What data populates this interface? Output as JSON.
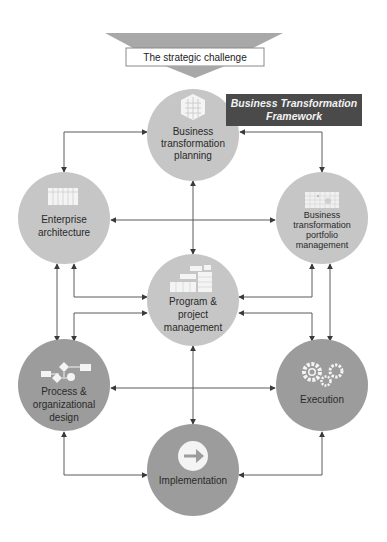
{
  "header": {
    "challenge_label": "The strategic challenge",
    "framework_label_line1": "Business Transformation",
    "framework_label_line2": "Framework"
  },
  "colors": {
    "light_node": "#c6c6c6",
    "dark_node": "#9c9c9c",
    "banner_bg": "#4a4a4a",
    "funnel": "#a8a8a8",
    "connector": "#5a5a5a"
  },
  "nodes": [
    {
      "id": "business-transformation-planning",
      "lines": [
        "Business",
        "transformation",
        "planning"
      ],
      "icon": "hexagon-grid-icon",
      "shade": "light"
    },
    {
      "id": "enterprise-architecture",
      "lines": [
        "Enterprise",
        "architecture"
      ],
      "icon": "table-grid-icon",
      "shade": "light"
    },
    {
      "id": "business-transformation-portfolio-management",
      "lines": [
        "Business",
        "transformation",
        "portfolio",
        "management"
      ],
      "icon": "portfolio-matrix-icon",
      "shade": "light"
    },
    {
      "id": "program-project-management",
      "lines": [
        "Program &",
        "project",
        "management"
      ],
      "icon": "gantt-chart-icon",
      "shade": "light"
    },
    {
      "id": "process-organizational-design",
      "lines": [
        "Process &",
        "organizational",
        "design"
      ],
      "icon": "flowchart-icon",
      "shade": "dark"
    },
    {
      "id": "execution",
      "lines": [
        "Execution"
      ],
      "icon": "gears-icon",
      "shade": "dark"
    },
    {
      "id": "implementation",
      "lines": [
        "Implementation"
      ],
      "icon": "arrow-right-circle-icon",
      "shade": "dark"
    }
  ]
}
